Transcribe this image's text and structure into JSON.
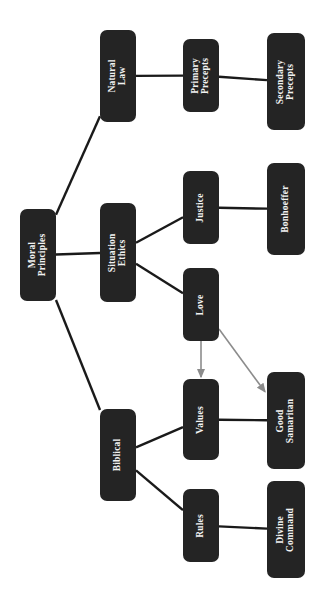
{
  "diagram": {
    "title": "Moral Principles",
    "type": "hierarchy-tree",
    "orientation": "rotated-90-counterclockwise",
    "background_color": "#ffffff",
    "node_fill_color": "#242424",
    "node_text_color": "#f2f2f2",
    "solid_edge_color": "#1a1a1a",
    "arrow_edge_color": "#8c8c8c",
    "nodes": [
      {
        "id": "moral_principles",
        "label": "Moral\nPrinciples",
        "x": 20,
        "y": 209,
        "w": 36,
        "h": 92,
        "level": 0
      },
      {
        "id": "natural_law",
        "label": "Natural\nLaw",
        "x": 100,
        "y": 30,
        "w": 36,
        "h": 92,
        "level": 1
      },
      {
        "id": "situation_ethics",
        "label": "Situation\nEthics",
        "x": 100,
        "y": 203,
        "w": 36,
        "h": 99,
        "level": 1
      },
      {
        "id": "biblical",
        "label": "Biblical",
        "x": 100,
        "y": 409,
        "w": 36,
        "h": 92,
        "level": 1
      },
      {
        "id": "primary_precepts",
        "label": "Primary\nPrecepts",
        "x": 183,
        "y": 39,
        "w": 36,
        "h": 73,
        "level": 2
      },
      {
        "id": "justice",
        "label": "Justice",
        "x": 183,
        "y": 171,
        "w": 36,
        "h": 73,
        "level": 2
      },
      {
        "id": "love",
        "label": "Love",
        "x": 183,
        "y": 268,
        "w": 36,
        "h": 73,
        "level": 2
      },
      {
        "id": "values",
        "label": "Values",
        "x": 183,
        "y": 379,
        "w": 36,
        "h": 81,
        "level": 2
      },
      {
        "id": "rules",
        "label": "Rules",
        "x": 183,
        "y": 489,
        "w": 36,
        "h": 73,
        "level": 2
      },
      {
        "id": "secondary_precepts",
        "label": "Secondary\nPrecepts",
        "x": 267,
        "y": 33,
        "w": 38,
        "h": 97,
        "level": 3
      },
      {
        "id": "bonhoeffer",
        "label": "Bonhoeffer",
        "x": 267,
        "y": 163,
        "w": 38,
        "h": 92,
        "level": 3
      },
      {
        "id": "good_samaritan",
        "label": "Good\nSamaritan",
        "x": 267,
        "y": 372,
        "w": 38,
        "h": 97,
        "level": 3
      },
      {
        "id": "divine_command",
        "label": "Divine\nCommand",
        "x": 267,
        "y": 481,
        "w": 38,
        "h": 97,
        "level": 3
      }
    ],
    "edges": [
      {
        "id": "e-mp-nl",
        "from": "moral_principles",
        "to": "natural_law",
        "style": "solid",
        "arrow": false
      },
      {
        "id": "e-mp-se",
        "from": "moral_principles",
        "to": "situation_ethics",
        "style": "solid",
        "arrow": false
      },
      {
        "id": "e-mp-bi",
        "from": "moral_principles",
        "to": "biblical",
        "style": "solid",
        "arrow": false
      },
      {
        "id": "e-nl-pp",
        "from": "natural_law",
        "to": "primary_precepts",
        "style": "solid",
        "arrow": false
      },
      {
        "id": "e-pp-sp",
        "from": "primary_precepts",
        "to": "secondary_precepts",
        "style": "solid",
        "arrow": false
      },
      {
        "id": "e-se-ju",
        "from": "situation_ethics",
        "to": "justice",
        "style": "solid",
        "arrow": false
      },
      {
        "id": "e-se-lo",
        "from": "situation_ethics",
        "to": "love",
        "style": "solid",
        "arrow": false
      },
      {
        "id": "e-ju-bo",
        "from": "justice",
        "to": "bonhoeffer",
        "style": "solid",
        "arrow": false
      },
      {
        "id": "e-bi-va",
        "from": "biblical",
        "to": "values",
        "style": "solid",
        "arrow": false
      },
      {
        "id": "e-bi-ru",
        "from": "biblical",
        "to": "rules",
        "style": "solid",
        "arrow": false
      },
      {
        "id": "e-va-gs",
        "from": "values",
        "to": "good_samaritan",
        "style": "solid",
        "arrow": false
      },
      {
        "id": "e-ru-dc",
        "from": "rules",
        "to": "divine_command",
        "style": "solid",
        "arrow": false
      },
      {
        "id": "e-lo-va",
        "from": "love",
        "to": "values",
        "style": "arrow",
        "arrow": true
      },
      {
        "id": "e-lo-gs",
        "from": "love",
        "to": "good_samaritan",
        "style": "arrow",
        "arrow": true
      }
    ]
  }
}
